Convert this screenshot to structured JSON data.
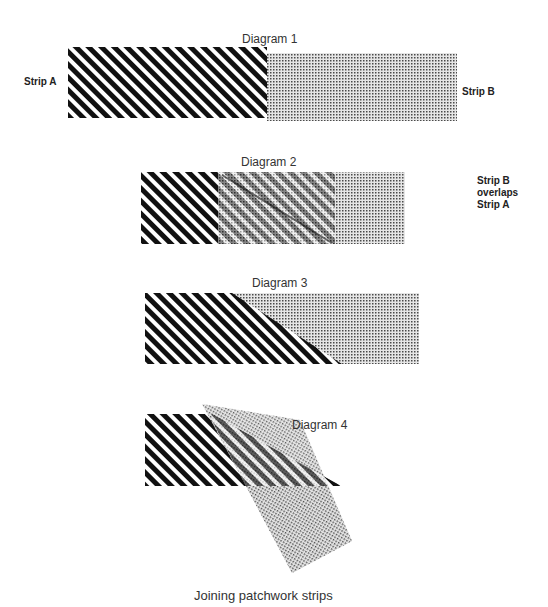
{
  "figure": {
    "caption": "Joining patchwork strips",
    "strip_a_pattern": "diagonal-stripes",
    "strip_b_pattern": "dot-screen",
    "colors": {
      "stripe": "#111111",
      "dots": "#555555",
      "background": "#ffffff"
    }
  },
  "diagrams": [
    {
      "title": "Diagram 1",
      "labels": {
        "left": "Strip A",
        "right": "Strip B"
      }
    },
    {
      "title": "Diagram 2",
      "note_lines": [
        "Strip B",
        "overlaps",
        "Strip A"
      ]
    },
    {
      "title": "Diagram 3"
    },
    {
      "title": "Diagram 4"
    }
  ]
}
